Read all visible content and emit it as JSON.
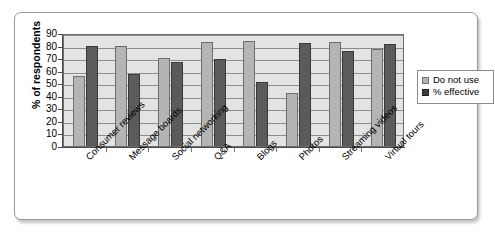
{
  "chart_data": {
    "type": "bar",
    "title": "",
    "xlabel": "",
    "ylabel": "% of respondents",
    "ylim": [
      0,
      90
    ],
    "ytick_step": 10,
    "yticks": [
      "0",
      "10",
      "20",
      "30",
      "40",
      "50",
      "60",
      "70",
      "80",
      "90"
    ],
    "grid": true,
    "legend_position": "right",
    "categories": [
      "Consumer reviews",
      "Message boards",
      "Social networking",
      "Q&A",
      "Blogs",
      "Photos",
      "Streaming videos",
      "Virtual tours"
    ],
    "series": [
      {
        "name": "Do not use",
        "color": "#b4b4b4",
        "values": [
          56,
          80,
          70,
          83,
          84,
          42,
          83,
          77
        ]
      },
      {
        "name": "% effective",
        "color": "#5b5b5b",
        "values": [
          80,
          57,
          67,
          69,
          51,
          82,
          76,
          81
        ]
      }
    ]
  },
  "legend": {
    "items": [
      {
        "label": "Do not use",
        "swatch": "light"
      },
      {
        "label": "% effective",
        "swatch": "dark"
      }
    ]
  }
}
